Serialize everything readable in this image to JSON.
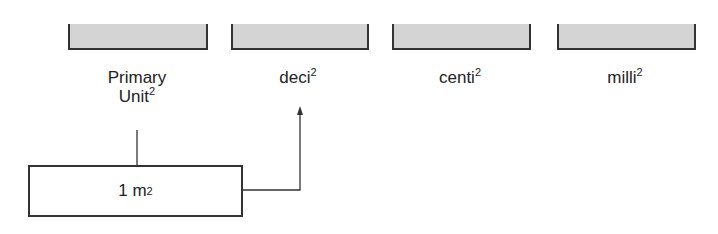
{
  "units": [
    {
      "name": "Primary",
      "line2": "Unit",
      "exponent": "2"
    },
    {
      "name": "deci",
      "exponent": "2"
    },
    {
      "name": "centi",
      "exponent": "2"
    },
    {
      "name": "milli",
      "exponent": "2"
    }
  ],
  "value_box": {
    "value": "1 m",
    "exponent": "2"
  },
  "colors": {
    "box_fill": "#d4d4d4",
    "stroke": "#333333"
  }
}
